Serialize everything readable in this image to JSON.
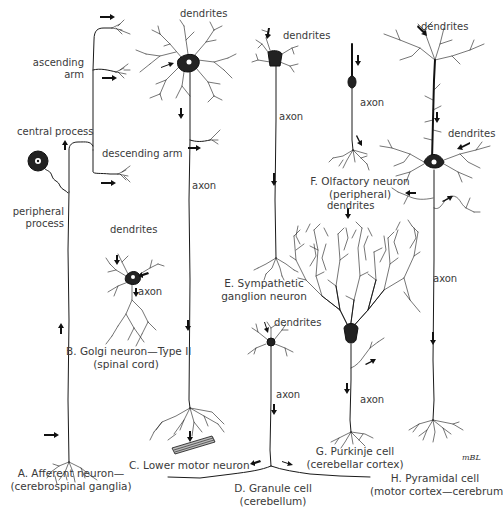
{
  "figure": {
    "signature": "mBL"
  },
  "neurons": [
    {
      "id": "A",
      "caption_line1": "A. Afferent neuron—",
      "caption_line2": "(cerebrospinal ganglia)",
      "labels": {
        "ascending_arm_1": "ascending",
        "ascending_arm_2": "arm",
        "central_process": "central process",
        "descending_arm": "descending arm",
        "peripheral_process_1": "peripheral",
        "peripheral_process_2": "process"
      }
    },
    {
      "id": "B",
      "caption_line1": "B. Golgi neuron—Type II",
      "caption_line2": "(spinal cord)",
      "labels": {
        "dendrites": "dendrites",
        "axon": "axon"
      }
    },
    {
      "id": "C",
      "caption_line1": "C. Lower motor neuron",
      "labels": {
        "dendrites": "dendrites",
        "axon": "axon"
      }
    },
    {
      "id": "D",
      "caption_line1": "D. Granule cell",
      "caption_line2": "(cerebellum)",
      "labels": {
        "dendrites": "dendrites",
        "axon": "axon"
      }
    },
    {
      "id": "E",
      "caption_line1": "E. Sympathetic",
      "caption_line2": "ganglion neuron",
      "labels": {
        "dendrites": "dendrites",
        "axon": "axon"
      }
    },
    {
      "id": "F",
      "caption_line1": "F. Olfactory neuron",
      "caption_line2": "(peripheral)",
      "labels": {
        "axon": "axon"
      }
    },
    {
      "id": "G",
      "caption_line1": "G. Purkinje cell",
      "caption_line2": "(cerebellar cortex)",
      "labels": {
        "dendrites": "dendrites",
        "axon": "axon"
      }
    },
    {
      "id": "H",
      "caption_line1": "H. Pyramidal cell",
      "caption_line2": "(motor cortex—cerebrum)",
      "labels": {
        "dendrites_top": "dendrites",
        "dendrites_basal": "dendrites",
        "axon": "axon"
      }
    }
  ]
}
